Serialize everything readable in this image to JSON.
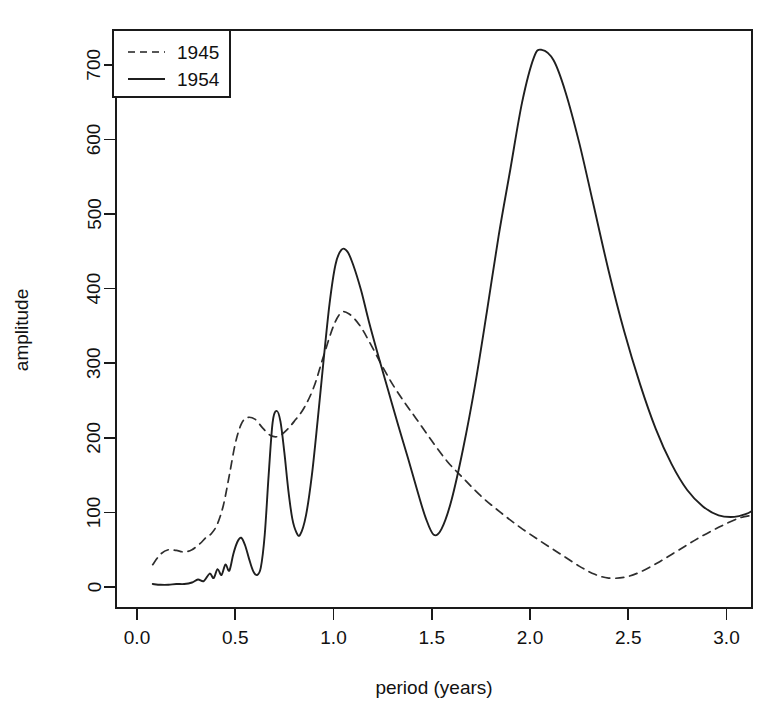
{
  "chart_data": {
    "type": "line",
    "title": "",
    "xlabel": "period (years)",
    "ylabel": "amplitude",
    "xlim": [
      0.03,
      3.15
    ],
    "ylim": [
      -15,
      745
    ],
    "xticks": [
      "0.0",
      "0.5",
      "1.0",
      "1.5",
      "2.0",
      "2.5",
      "3.0"
    ],
    "xtick_values": [
      0.0,
      0.5,
      1.0,
      1.5,
      2.0,
      2.5,
      3.0
    ],
    "yticks": [
      "0",
      "100",
      "200",
      "300",
      "400",
      "500",
      "600",
      "700"
    ],
    "ytick_values": [
      0,
      100,
      200,
      300,
      400,
      500,
      600,
      700
    ],
    "grid": false,
    "legend_position": "top-left",
    "series": [
      {
        "name": "1945",
        "style": "dashed",
        "color": "#2e2e2e",
        "x": [
          0.08,
          0.12,
          0.16,
          0.2,
          0.24,
          0.28,
          0.32,
          0.35,
          0.38,
          0.41,
          0.44,
          0.47,
          0.5,
          0.53,
          0.56,
          0.6,
          0.64,
          0.68,
          0.72,
          0.76,
          0.8,
          0.85,
          0.9,
          0.95,
          1.0,
          1.04,
          1.08,
          1.13,
          1.18,
          1.24,
          1.3,
          1.36,
          1.42,
          1.5,
          1.58,
          1.66,
          1.75,
          1.85,
          1.95,
          2.05,
          2.15,
          2.25,
          2.33,
          2.4,
          2.48,
          2.56,
          2.66,
          2.76,
          2.86,
          2.96,
          3.06,
          3.13
        ],
        "y": [
          30,
          44,
          50,
          49,
          47,
          50,
          58,
          66,
          72,
          85,
          110,
          150,
          192,
          218,
          227,
          225,
          213,
          203,
          202,
          210,
          222,
          240,
          268,
          310,
          350,
          368,
          366,
          352,
          330,
          300,
          272,
          248,
          226,
          196,
          168,
          146,
          122,
          100,
          80,
          62,
          45,
          28,
          17,
          12,
          13,
          20,
          34,
          50,
          66,
          80,
          92,
          96
        ]
      },
      {
        "name": "1954",
        "style": "solid",
        "color": "#1f1f1f",
        "x": [
          0.08,
          0.12,
          0.16,
          0.2,
          0.24,
          0.28,
          0.31,
          0.34,
          0.37,
          0.39,
          0.41,
          0.43,
          0.45,
          0.47,
          0.49,
          0.51,
          0.53,
          0.55,
          0.57,
          0.59,
          0.61,
          0.63,
          0.65,
          0.67,
          0.69,
          0.71,
          0.73,
          0.75,
          0.77,
          0.79,
          0.81,
          0.83,
          0.86,
          0.89,
          0.92,
          0.95,
          0.98,
          1.01,
          1.04,
          1.07,
          1.1,
          1.14,
          1.18,
          1.23,
          1.28,
          1.33,
          1.38,
          1.43,
          1.47,
          1.51,
          1.55,
          1.6,
          1.66,
          1.72,
          1.78,
          1.84,
          1.9,
          1.96,
          2.02,
          2.06,
          2.12,
          2.18,
          2.25,
          2.32,
          2.4,
          2.48,
          2.56,
          2.64,
          2.72,
          2.8,
          2.88,
          2.96,
          3.04,
          3.1,
          3.13
        ],
        "y": [
          4,
          3,
          3,
          4,
          4,
          6,
          10,
          8,
          18,
          12,
          24,
          16,
          30,
          22,
          44,
          60,
          66,
          56,
          38,
          22,
          16,
          26,
          70,
          150,
          220,
          236,
          222,
          180,
          130,
          92,
          74,
          70,
          96,
          150,
          225,
          305,
          380,
          432,
          452,
          450,
          432,
          398,
          356,
          308,
          262,
          216,
          172,
          126,
          92,
          70,
          78,
          116,
          186,
          270,
          368,
          470,
          560,
          650,
          710,
          720,
          706,
          664,
          596,
          516,
          424,
          342,
          272,
          212,
          165,
          130,
          108,
          96,
          94,
          98,
          102
        ]
      }
    ]
  },
  "legend": {
    "entries": [
      {
        "label": "1945",
        "style": "dashed"
      },
      {
        "label": "1954",
        "style": "solid"
      }
    ]
  },
  "axes": {
    "x_title": "period (years)",
    "y_title": "amplitude"
  }
}
